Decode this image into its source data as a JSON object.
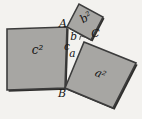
{
  "diagram": {
    "vertices": [
      {
        "label": "A"
      },
      {
        "label": "B"
      },
      {
        "label": "C"
      }
    ],
    "sides": [
      {
        "label": "a"
      },
      {
        "label": "b"
      },
      {
        "label": "c"
      }
    ],
    "squares": [
      {
        "label": "a²"
      },
      {
        "label": "b²"
      },
      {
        "label": "c²"
      }
    ],
    "colors": {
      "square_fill": "#a7a6a3",
      "edge": "#3c3c3c",
      "shadow": "#2e2d2b",
      "background": "#f3f2ef",
      "text": "#141414"
    }
  }
}
